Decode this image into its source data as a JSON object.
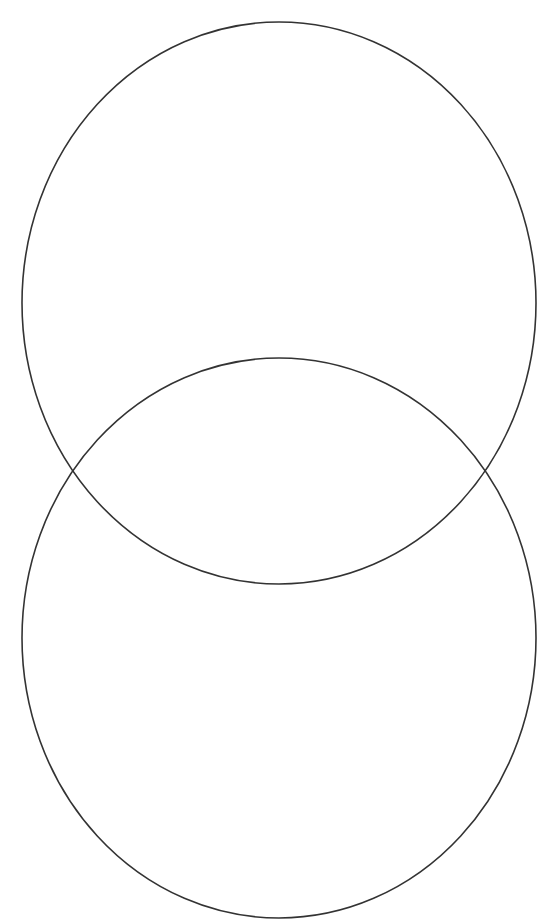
{
  "diagram": {
    "type": "venn",
    "orientation": "vertical",
    "background": "#ffffff",
    "stroke_color": "#333333",
    "stroke_width": 1.6,
    "sets": [
      {
        "id": "top",
        "label": "",
        "cx": 279,
        "cy": 303,
        "rx": 257,
        "ry": 281
      },
      {
        "id": "bottom",
        "label": "",
        "cx": 279,
        "cy": 638,
        "rx": 257,
        "ry": 280
      }
    ]
  }
}
